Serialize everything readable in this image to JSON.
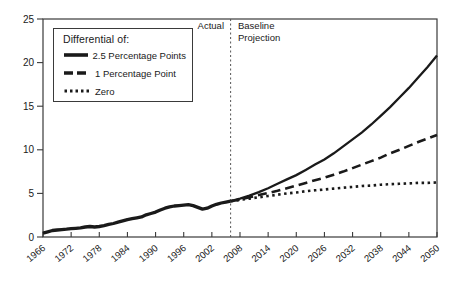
{
  "chart_data": {
    "type": "line",
    "title": "",
    "xlabel": "",
    "ylabel": "",
    "xlim": [
      1966,
      2050
    ],
    "ylim": [
      0,
      25
    ],
    "x_ticks": [
      1966,
      1972,
      1978,
      1984,
      1990,
      1996,
      2002,
      2008,
      2014,
      2020,
      2026,
      2032,
      2038,
      2044,
      2050
    ],
    "y_ticks": [
      0,
      5,
      10,
      15,
      20,
      25
    ],
    "grid": false,
    "line_color": "#1a1a1a",
    "axis_color": "#3a3a3a",
    "divider": {
      "year": 2006,
      "label_left": "Actual",
      "label_right": "Baseline\nProjection"
    },
    "legend": {
      "title": "Differential of:",
      "position": "top-left"
    },
    "history": {
      "x": [
        1966,
        1967,
        1968,
        1969,
        1970,
        1971,
        1972,
        1973,
        1974,
        1975,
        1976,
        1977,
        1978,
        1979,
        1980,
        1981,
        1982,
        1983,
        1984,
        1985,
        1986,
        1987,
        1988,
        1989,
        1990,
        1991,
        1992,
        1993,
        1994,
        1995,
        1996,
        1997,
        1998,
        1999,
        2000,
        2001,
        2002,
        2003,
        2004,
        2005,
        2006
      ],
      "values": [
        0.45,
        0.6,
        0.75,
        0.8,
        0.85,
        0.9,
        0.95,
        1.0,
        1.05,
        1.15,
        1.2,
        1.15,
        1.2,
        1.3,
        1.45,
        1.55,
        1.7,
        1.85,
        2.0,
        2.1,
        2.2,
        2.3,
        2.55,
        2.7,
        2.85,
        3.1,
        3.3,
        3.45,
        3.55,
        3.6,
        3.65,
        3.7,
        3.6,
        3.4,
        3.2,
        3.3,
        3.55,
        3.75,
        3.9,
        4.0,
        4.1
      ]
    },
    "series": [
      {
        "name": "2.5 Percentage Points",
        "style": "solid",
        "x": [
          2006,
          2008,
          2010,
          2012,
          2014,
          2016,
          2018,
          2020,
          2022,
          2024,
          2026,
          2028,
          2030,
          2032,
          2034,
          2036,
          2038,
          2040,
          2042,
          2044,
          2046,
          2048,
          2050
        ],
        "values": [
          4.1,
          4.4,
          4.75,
          5.15,
          5.6,
          6.1,
          6.6,
          7.1,
          7.7,
          8.3,
          8.9,
          9.6,
          10.4,
          11.2,
          12.0,
          12.9,
          13.9,
          14.9,
          16.0,
          17.1,
          18.3,
          19.5,
          20.8
        ]
      },
      {
        "name": "1 Percentage Point",
        "style": "dashed",
        "x": [
          2006,
          2008,
          2010,
          2012,
          2014,
          2016,
          2018,
          2020,
          2022,
          2024,
          2026,
          2028,
          2030,
          2032,
          2034,
          2036,
          2038,
          2040,
          2042,
          2044,
          2046,
          2048,
          2050
        ],
        "values": [
          4.1,
          4.3,
          4.55,
          4.8,
          5.05,
          5.3,
          5.6,
          5.9,
          6.2,
          6.5,
          6.8,
          7.15,
          7.5,
          7.9,
          8.3,
          8.7,
          9.1,
          9.6,
          10.0,
          10.45,
          10.9,
          11.3,
          11.7
        ]
      },
      {
        "name": "Zero",
        "style": "dotted",
        "x": [
          2006,
          2008,
          2010,
          2012,
          2014,
          2016,
          2018,
          2020,
          2022,
          2024,
          2026,
          2028,
          2030,
          2032,
          2034,
          2036,
          2038,
          2040,
          2042,
          2044,
          2046,
          2048,
          2050
        ],
        "values": [
          4.1,
          4.25,
          4.4,
          4.55,
          4.7,
          4.85,
          5.0,
          5.1,
          5.25,
          5.35,
          5.45,
          5.55,
          5.65,
          5.75,
          5.85,
          5.9,
          6.0,
          6.05,
          6.1,
          6.15,
          6.2,
          6.2,
          6.25
        ]
      }
    ]
  }
}
